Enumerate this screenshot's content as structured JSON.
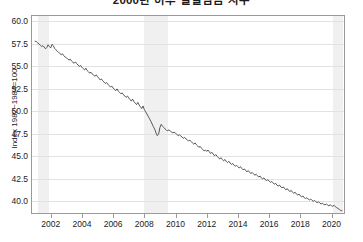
{
  "chart": {
    "title": "2000년 이후 실질임금 지수",
    "ylabel": "Index 1982~1984=100"
  },
  "chart_data": {
    "type": "line",
    "title": "2000년 이후 실질임금 지수",
    "xlabel": "",
    "ylabel": "Index 1982~1984=100",
    "xlim": [
      2000.8,
      2020.8
    ],
    "ylim": [
      38.7,
      60.6
    ],
    "grid": true,
    "legend": "none",
    "yticks": [
      60.0,
      57.5,
      55.0,
      52.5,
      50.0,
      47.5,
      45.0,
      42.5,
      40.0
    ],
    "ytick_labels": [
      "60.0",
      "57.5",
      "55.0",
      "52.5",
      "50.0",
      "47.5",
      "45.0",
      "42.5",
      "40.0"
    ],
    "xticks": [
      2002,
      2004,
      2006,
      2008,
      2010,
      2012,
      2014,
      2016,
      2018,
      2020
    ],
    "xtick_labels": [
      "2002",
      "2004",
      "2006",
      "2008",
      "2010",
      "2012",
      "2014",
      "2016",
      "2018",
      "2020"
    ],
    "line_color": "#555555",
    "grid_color": "#e2e2e2",
    "band_color": "#f0f0f0",
    "shaded_bands": [
      {
        "label": "recession-2001",
        "start": 2001.2,
        "end": 2001.92
      },
      {
        "label": "recession-2008",
        "start": 2007.95,
        "end": 2009.5
      },
      {
        "label": "recession-2020",
        "start": 2020.12,
        "end": 2020.75
      }
    ],
    "series": [
      {
        "name": "real-wage-index",
        "x": [
          2001.0,
          2001.08,
          2001.17,
          2001.25,
          2001.33,
          2001.42,
          2001.5,
          2001.58,
          2001.67,
          2001.75,
          2001.83,
          2001.92,
          2002.0,
          2002.08,
          2002.17,
          2002.25,
          2002.33,
          2002.42,
          2002.5,
          2002.58,
          2002.67,
          2002.75,
          2002.83,
          2002.92,
          2003.0,
          2003.08,
          2003.17,
          2003.25,
          2003.33,
          2003.42,
          2003.5,
          2003.58,
          2003.67,
          2003.75,
          2003.83,
          2003.92,
          2004.0,
          2004.08,
          2004.17,
          2004.25,
          2004.33,
          2004.42,
          2004.5,
          2004.58,
          2004.67,
          2004.75,
          2004.83,
          2004.92,
          2005.0,
          2005.08,
          2005.17,
          2005.25,
          2005.33,
          2005.42,
          2005.5,
          2005.58,
          2005.67,
          2005.75,
          2005.83,
          2005.92,
          2006.0,
          2006.08,
          2006.17,
          2006.25,
          2006.33,
          2006.42,
          2006.5,
          2006.58,
          2006.67,
          2006.75,
          2006.83,
          2006.92,
          2007.0,
          2007.08,
          2007.17,
          2007.25,
          2007.33,
          2007.42,
          2007.5,
          2007.58,
          2007.67,
          2007.75,
          2007.83,
          2007.92,
          2008.0,
          2008.08,
          2008.17,
          2008.25,
          2008.33,
          2008.42,
          2008.5,
          2008.58,
          2008.67,
          2008.75,
          2008.83,
          2008.92,
          2009.0,
          2009.08,
          2009.17,
          2009.25,
          2009.33,
          2009.42,
          2009.5,
          2009.58,
          2009.67,
          2009.75,
          2009.83,
          2009.92,
          2010.0,
          2010.08,
          2010.17,
          2010.25,
          2010.33,
          2010.42,
          2010.5,
          2010.58,
          2010.67,
          2010.75,
          2010.83,
          2010.92,
          2011.0,
          2011.08,
          2011.17,
          2011.25,
          2011.33,
          2011.42,
          2011.5,
          2011.58,
          2011.67,
          2011.75,
          2011.83,
          2011.92,
          2012.0,
          2012.08,
          2012.17,
          2012.25,
          2012.33,
          2012.42,
          2012.5,
          2012.58,
          2012.67,
          2012.75,
          2012.83,
          2012.92,
          2013.0,
          2013.08,
          2013.17,
          2013.25,
          2013.33,
          2013.42,
          2013.5,
          2013.58,
          2013.67,
          2013.75,
          2013.83,
          2013.92,
          2014.0,
          2014.08,
          2014.17,
          2014.25,
          2014.33,
          2014.42,
          2014.5,
          2014.58,
          2014.67,
          2014.75,
          2014.83,
          2014.92,
          2015.0,
          2015.08,
          2015.17,
          2015.25,
          2015.33,
          2015.42,
          2015.5,
          2015.58,
          2015.67,
          2015.75,
          2015.83,
          2015.92,
          2016.0,
          2016.08,
          2016.17,
          2016.25,
          2016.33,
          2016.42,
          2016.5,
          2016.58,
          2016.67,
          2016.75,
          2016.83,
          2016.92,
          2017.0,
          2017.08,
          2017.17,
          2017.25,
          2017.33,
          2017.42,
          2017.5,
          2017.58,
          2017.67,
          2017.75,
          2017.83,
          2017.92,
          2018.0,
          2018.08,
          2018.17,
          2018.25,
          2018.33,
          2018.42,
          2018.5,
          2018.58,
          2018.67,
          2018.75,
          2018.83,
          2018.92,
          2019.0,
          2019.08,
          2019.17,
          2019.25,
          2019.33,
          2019.42,
          2019.5,
          2019.58,
          2019.67,
          2019.75,
          2019.83,
          2019.92,
          2020.0,
          2020.08,
          2020.17,
          2020.25,
          2020.33,
          2020.42,
          2020.5,
          2020.58,
          2020.67
        ],
        "values": [
          57.8,
          57.75,
          57.6,
          57.5,
          57.35,
          57.2,
          57.3,
          57.15,
          56.95,
          57.1,
          57.4,
          57.2,
          57.05,
          57.45,
          57.3,
          57.0,
          56.85,
          56.7,
          56.55,
          56.45,
          56.3,
          56.4,
          56.2,
          56.05,
          55.95,
          55.85,
          55.7,
          55.8,
          55.6,
          55.45,
          55.35,
          55.5,
          55.3,
          55.15,
          55.0,
          55.1,
          54.9,
          54.75,
          54.6,
          54.8,
          54.55,
          54.4,
          54.25,
          54.35,
          54.15,
          54.0,
          53.9,
          54.05,
          53.85,
          53.7,
          53.5,
          53.6,
          53.4,
          53.25,
          53.1,
          53.2,
          53.0,
          52.85,
          52.7,
          52.8,
          52.6,
          52.45,
          52.3,
          52.5,
          52.25,
          52.1,
          51.95,
          52.05,
          51.85,
          51.7,
          51.55,
          51.7,
          51.5,
          51.3,
          51.15,
          51.35,
          51.1,
          50.9,
          50.75,
          51.0,
          50.7,
          50.5,
          50.3,
          50.6,
          50.2,
          49.95,
          49.7,
          49.45,
          49.2,
          48.9,
          48.6,
          48.3,
          48.0,
          47.6,
          47.3,
          47.5,
          48.2,
          48.55,
          48.35,
          48.2,
          48.05,
          47.9,
          47.85,
          47.95,
          47.8,
          47.7,
          47.6,
          47.7,
          47.55,
          47.45,
          47.3,
          47.4,
          47.25,
          47.15,
          47.0,
          47.1,
          46.95,
          46.85,
          46.7,
          46.8,
          46.65,
          46.5,
          46.35,
          46.5,
          46.3,
          46.15,
          46.0,
          46.1,
          45.9,
          45.75,
          45.6,
          45.7,
          45.55,
          45.7,
          45.5,
          45.3,
          45.45,
          45.25,
          45.05,
          45.2,
          45.0,
          44.85,
          44.7,
          44.85,
          44.65,
          44.5,
          44.65,
          44.45,
          44.3,
          44.45,
          44.25,
          44.1,
          44.2,
          44.0,
          43.9,
          44.0,
          43.85,
          43.7,
          43.85,
          43.65,
          43.5,
          43.6,
          43.4,
          43.3,
          43.4,
          43.2,
          43.1,
          43.2,
          43.05,
          42.9,
          43.0,
          42.85,
          42.7,
          42.8,
          42.6,
          42.5,
          42.6,
          42.4,
          42.3,
          42.4,
          42.25,
          42.1,
          42.2,
          42.05,
          41.9,
          42.0,
          41.8,
          41.7,
          41.8,
          41.6,
          41.5,
          41.6,
          41.4,
          41.3,
          41.4,
          41.2,
          41.1,
          41.2,
          41.0,
          40.9,
          41.0,
          40.8,
          40.7,
          40.8,
          40.6,
          40.5,
          40.6,
          40.4,
          40.3,
          40.4,
          40.25,
          40.15,
          40.25,
          40.1,
          40.0,
          40.1,
          39.95,
          39.85,
          39.95,
          39.8,
          39.7,
          39.8,
          39.65,
          39.6,
          39.7,
          39.6,
          39.5,
          39.6,
          39.5,
          39.45,
          39.55,
          39.4,
          39.3,
          39.2,
          39.1,
          39.0,
          38.95
        ]
      }
    ]
  }
}
